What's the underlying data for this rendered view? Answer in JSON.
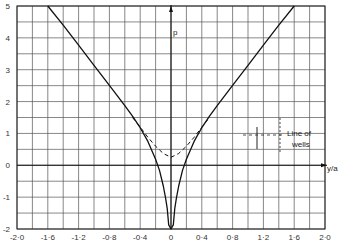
{
  "chart_data": {
    "type": "line",
    "title": "",
    "xlabel": "y/a",
    "ylabel": "p",
    "xlim": [
      -2.0,
      2.0
    ],
    "ylim": [
      -2,
      5
    ],
    "grid": true,
    "x_ticks": [
      "-2·0",
      "-1·6",
      "-1·2",
      "-0·8",
      "-0·4",
      "0",
      "0·4",
      "0·8",
      "1·2",
      "1·6",
      "2·0"
    ],
    "x_tick_values": [
      -2.0,
      -1.6,
      -1.2,
      -0.8,
      -0.4,
      0,
      0.4,
      0.8,
      1.2,
      1.6,
      2.0
    ],
    "y_ticks": [
      "5",
      "4",
      "3",
      "2",
      "1",
      "0",
      "-1",
      "-2"
    ],
    "y_tick_values": [
      5,
      4,
      3,
      2,
      1,
      0,
      -1,
      -2
    ],
    "series": [
      {
        "name": "solid",
        "style": "solid",
        "x": [
          -1.6,
          -1.4,
          -1.2,
          -1.0,
          -0.8,
          -0.6,
          -0.5,
          -0.4,
          -0.3,
          -0.2,
          -0.15,
          -0.1,
          -0.07,
          -0.05,
          -0.03,
          0,
          0.03,
          0.05,
          0.07,
          0.1,
          0.15,
          0.2,
          0.3,
          0.4,
          0.5,
          0.6,
          0.8,
          1.0,
          1.2,
          1.4,
          1.6
        ],
        "values": [
          5.03,
          4.4,
          3.77,
          3.14,
          2.51,
          1.87,
          1.54,
          1.18,
          0.75,
          0.19,
          -0.16,
          -0.65,
          -1.03,
          -1.35,
          -1.87,
          -2.0,
          -1.87,
          -1.35,
          -1.03,
          -0.65,
          -0.16,
          0.19,
          0.75,
          1.18,
          1.54,
          1.87,
          2.51,
          3.14,
          3.77,
          4.4,
          5.03
        ]
      },
      {
        "name": "dashed",
        "style": "dashed",
        "x": [
          -0.5,
          -0.4,
          -0.3,
          -0.2,
          -0.1,
          0,
          0.1,
          0.2,
          0.3,
          0.4,
          0.5
        ],
        "values": [
          1.5,
          1.2,
          0.88,
          0.6,
          0.37,
          0.25,
          0.37,
          0.6,
          0.88,
          1.2,
          1.5
        ]
      }
    ],
    "annotations": [
      {
        "text": "Line of",
        "x": 1.15,
        "y": 1.05
      },
      {
        "text": "wells",
        "x": 1.15,
        "y": 0.72
      }
    ]
  },
  "labels": {
    "p_axis": "p",
    "x_axis": "y/a",
    "line_of": "Line of",
    "wells": "wells"
  }
}
